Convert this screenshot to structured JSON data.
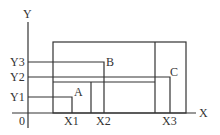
{
  "diagram": {
    "axes": {
      "x_label": "X",
      "y_label": "Y",
      "origin_label": "0"
    },
    "x_ticks": [
      "X1",
      "X2",
      "X3"
    ],
    "y_ticks": [
      "Y1",
      "Y2",
      "Y3"
    ],
    "points": [
      {
        "label": "A",
        "x": "X1",
        "y": "Y1"
      },
      {
        "label": "B",
        "x": "X2",
        "y": "Y3"
      },
      {
        "label": "C",
        "x": "X3",
        "y": "Y2"
      }
    ],
    "colors": {
      "line": "#333333",
      "background": "#ffffff"
    }
  }
}
